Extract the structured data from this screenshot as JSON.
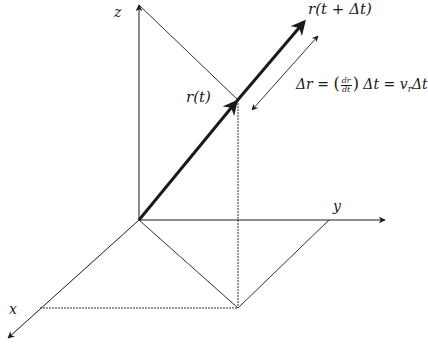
{
  "diagram": {
    "colors": {
      "line": "#1a1a1a",
      "background": "#ffffff"
    },
    "axes": {
      "z": {
        "label": "z",
        "from": [
          139,
          220
        ],
        "to": [
          139,
          5
        ]
      },
      "y": {
        "label": "y",
        "from": [
          139,
          220
        ],
        "to": [
          385,
          220
        ]
      },
      "x": {
        "label": "x",
        "from": [
          139,
          220
        ],
        "to": [
          8,
          338
        ]
      }
    },
    "vectors": {
      "r_t": {
        "label": "r(t)",
        "from": [
          139,
          220
        ],
        "to": [
          238,
          100
        ]
      },
      "r_t_dt": {
        "label": "r(t + Δt)",
        "from": [
          238,
          100
        ],
        "to": [
          306,
          20
        ]
      }
    },
    "delta_r": {
      "arrow_from": [
        252,
        110
      ],
      "arrow_to": [
        318,
        36
      ],
      "equation": {
        "lhs": "Δr = ",
        "frac_num": "dr",
        "frac_den": "dt",
        "rhs_1": " Δt = v",
        "subscript": "r",
        "rhs_2": "Δt"
      }
    },
    "construction_lines": {
      "z_to_point": {
        "from": [
          139,
          5
        ],
        "to": [
          238,
          100
        ]
      },
      "vertical_drop": {
        "from": [
          238,
          100
        ],
        "to": [
          238,
          308
        ]
      },
      "origin_to_foot": {
        "from": [
          139,
          220
        ],
        "to": [
          238,
          308
        ]
      },
      "foot_to_y": {
        "from": [
          238,
          308
        ],
        "to": [
          329,
          220
        ]
      },
      "foot_to_x": {
        "from": [
          40,
          308
        ],
        "to": [
          238,
          308
        ]
      }
    }
  }
}
